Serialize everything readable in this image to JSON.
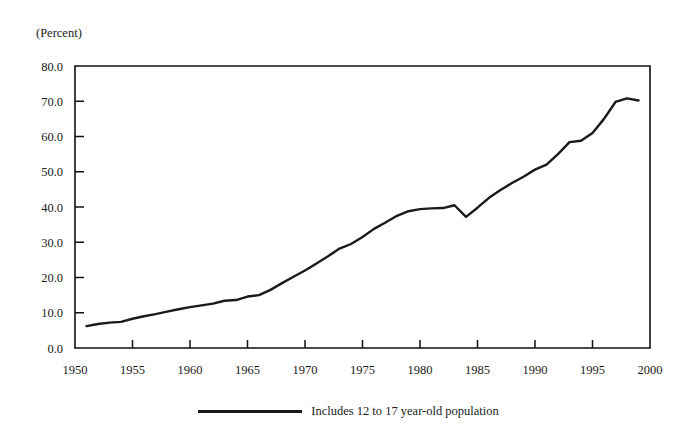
{
  "chart_data": {
    "type": "line",
    "title": "",
    "xlabel": "",
    "ylabel": "(Percent)",
    "unit_label": "(Percent)",
    "xlim": [
      1950,
      2000
    ],
    "ylim": [
      0.0,
      80.0
    ],
    "grid": false,
    "legend_position": "bottom-center",
    "x_ticks": [
      "1950",
      "1955",
      "1960",
      "1965",
      "1970",
      "1975",
      "1980",
      "1985",
      "1990",
      "1995",
      "2000"
    ],
    "x_tick_values": [
      1950,
      1955,
      1960,
      1965,
      1970,
      1975,
      1980,
      1985,
      1990,
      1995,
      2000
    ],
    "y_ticks": [
      "0.0",
      "10.0",
      "20.0",
      "30.0",
      "40.0",
      "50.0",
      "60.0",
      "70.0",
      "80.0"
    ],
    "y_tick_values": [
      0.0,
      10.0,
      20.0,
      30.0,
      40.0,
      50.0,
      60.0,
      70.0,
      80.0
    ],
    "series": [
      {
        "name": "Includes 12 to 17 year-old population",
        "color": "#1a1a1a",
        "x": [
          1951,
          1952,
          1953,
          1954,
          1955,
          1956,
          1957,
          1958,
          1959,
          1960,
          1961,
          1962,
          1963,
          1964,
          1965,
          1966,
          1967,
          1968,
          1969,
          1970,
          1971,
          1972,
          1973,
          1974,
          1975,
          1976,
          1977,
          1978,
          1979,
          1980,
          1981,
          1982,
          1983,
          1984,
          1985,
          1986,
          1987,
          1988,
          1989,
          1990,
          1991,
          1992,
          1993,
          1994,
          1995,
          1996,
          1997,
          1998,
          1999
        ],
        "values": [
          6.2,
          6.8,
          7.2,
          7.4,
          8.3,
          9.0,
          9.6,
          10.3,
          11.0,
          11.6,
          12.1,
          12.6,
          13.4,
          13.6,
          14.6,
          15.0,
          16.5,
          18.4,
          20.2,
          22.0,
          24.0,
          26.0,
          28.2,
          29.5,
          31.5,
          33.8,
          35.6,
          37.5,
          38.8,
          39.4,
          39.6,
          39.7,
          40.5,
          37.2,
          39.8,
          42.6,
          44.8,
          46.8,
          48.6,
          50.6,
          52.0,
          55.0,
          58.4,
          58.8,
          61.0,
          65.0,
          69.8,
          70.8,
          70.2
        ]
      }
    ],
    "legend": [
      {
        "label": "Includes 12 to 17 year-old population",
        "color": "#1a1a1a"
      }
    ]
  },
  "colors": {
    "background": "#ffffff",
    "ink": "#1a1a1a",
    "frame": "#111111"
  }
}
